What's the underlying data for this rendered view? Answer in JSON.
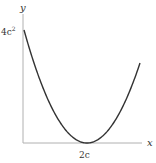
{
  "chart_data": {
    "type": "line",
    "title": "",
    "xlabel": "x",
    "ylabel": "y",
    "x_ticks": [
      {
        "value": "2c",
        "label": "2c"
      }
    ],
    "y_ticks": [
      {
        "value": "4c^2",
        "label": "4c²"
      }
    ],
    "series": [
      {
        "name": "y = (x - 2c)^2",
        "description": "Parabola starting at (0, 4c^2), vertex at (2c, 0), rising beyond",
        "x": [
          "0",
          "c",
          "2c",
          "3c",
          "3.5c"
        ],
        "values": [
          "4c^2",
          "c^2",
          "0",
          "c^2",
          "2.25c^2"
        ]
      }
    ],
    "grid": false,
    "legend": "none"
  },
  "labels": {
    "y_axis": "y",
    "x_axis": "x",
    "y_tick": "4c",
    "y_tick_exp": "2",
    "x_tick": "2c"
  },
  "colors": {
    "curve": "#333333",
    "axes": "#aaaaaa"
  }
}
